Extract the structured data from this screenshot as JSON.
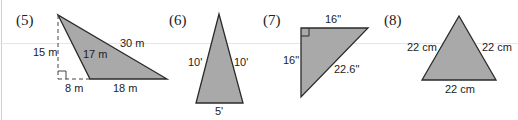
{
  "colors": {
    "fill": "#a9a9a9",
    "stroke": "#2a2a2a",
    "text": "#222222",
    "rule": "#e6e6e6"
  },
  "problems": [
    {
      "number": "(5)",
      "shape": "obtuse triangle with dashed height",
      "labels": {
        "height": "15 m",
        "left_side": "17 m",
        "hypotenuse": "30 m",
        "extension": "8 m",
        "base": "18 m"
      },
      "right_angle_marker": true
    },
    {
      "number": "(6)",
      "shape": "isosceles triangle",
      "labels": {
        "left_side": "10'",
        "right_side": "10'",
        "base": "5'"
      }
    },
    {
      "number": "(7)",
      "shape": "right triangle",
      "labels": {
        "top": "16\"",
        "left": "16\"",
        "hypotenuse": "22.6\""
      },
      "right_angle_marker": true
    },
    {
      "number": "(8)",
      "shape": "equilateral triangle",
      "labels": {
        "left_side": "22 cm",
        "right_side": "22 cm",
        "base": "22 cm"
      }
    }
  ]
}
